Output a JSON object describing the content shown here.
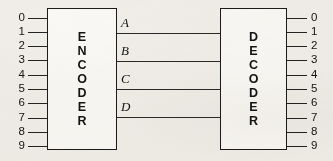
{
  "diagram": {
    "background_color": "#f2f0ec",
    "line_color": "#232323",
    "text_color": "#141414"
  },
  "encoder": {
    "name": "ENCODER",
    "letters": [
      "E",
      "N",
      "C",
      "O",
      "D",
      "E",
      "R"
    ],
    "inputs": [
      "0",
      "1",
      "2",
      "3",
      "4",
      "5",
      "6",
      "7",
      "8",
      "9"
    ]
  },
  "decoder": {
    "name": "DECODER",
    "letters": [
      "D",
      "E",
      "C",
      "O",
      "D",
      "E",
      "R"
    ],
    "outputs": [
      "0",
      "1",
      "2",
      "3",
      "4",
      "5",
      "6",
      "7",
      "8",
      "9"
    ]
  },
  "bus": {
    "lines": [
      {
        "label": "A"
      },
      {
        "label": "B"
      },
      {
        "label": "C"
      },
      {
        "label": "D"
      }
    ]
  }
}
